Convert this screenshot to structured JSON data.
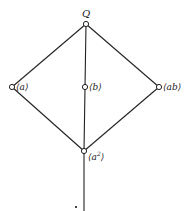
{
  "diagram": {
    "type": "subgroup-lattice",
    "nodes": [
      {
        "id": "Q",
        "label": "Q",
        "x": 86,
        "y": 24
      },
      {
        "id": "a",
        "label": "⟨a⟩",
        "x": 12,
        "y": 87
      },
      {
        "id": "b",
        "label": "⟨b⟩",
        "x": 85,
        "y": 87
      },
      {
        "id": "ab",
        "label": "⟨ab⟩",
        "x": 159,
        "y": 87
      },
      {
        "id": "a2",
        "label": "⟨a²⟩",
        "x": 84,
        "y": 151
      }
    ],
    "edges": [
      [
        "Q",
        "a"
      ],
      [
        "Q",
        "b"
      ],
      [
        "Q",
        "ab"
      ],
      [
        "a",
        "a2"
      ],
      [
        "b",
        "a2"
      ],
      [
        "ab",
        "a2"
      ],
      [
        "a2",
        "bottom"
      ]
    ],
    "labels": {
      "top": "Q",
      "a": "⟨a⟩",
      "b": "⟨b⟩",
      "ab": "⟨ab⟩",
      "a2_base": "⟨a",
      "a2_exp": "2",
      "a2_close": "⟩"
    }
  }
}
